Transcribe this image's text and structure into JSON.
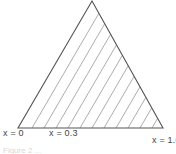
{
  "diagram": {
    "type": "ternary-triangle-hatched",
    "stroke_color": "#555555",
    "hatch_color": "#888888",
    "vertices": {
      "apex": [
        92,
        1
      ],
      "bottom_left": [
        18,
        128
      ],
      "bottom_right": [
        163,
        128
      ]
    },
    "hatch_base_x": [
      32,
      44,
      56,
      68,
      80,
      92,
      104,
      116,
      128,
      140,
      152
    ],
    "labels": {
      "left": "x = 0",
      "mid": "x = 0.3",
      "right": "x = 1.0"
    },
    "caption": "Figure 2  ..."
  }
}
